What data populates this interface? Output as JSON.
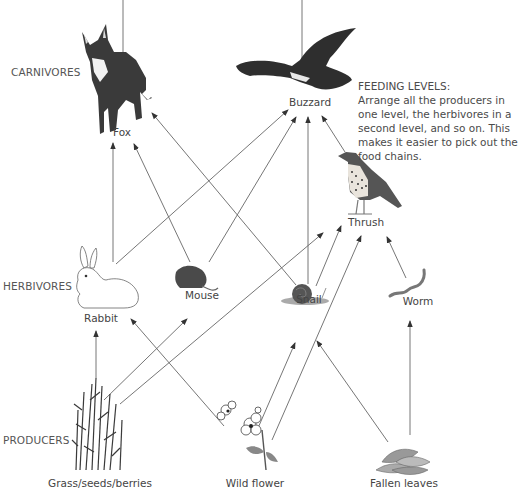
{
  "levels": {
    "carnivores": "CARNIVORES",
    "herbivores": "HERBIVORES",
    "producers": "PRODUCERS"
  },
  "organisms": {
    "fox": "Fox",
    "buzzard": "Buzzard",
    "thrush": "Thrush",
    "rabbit": "Rabbit",
    "mouse": "Mouse",
    "snail": "Snail",
    "worm": "Worm",
    "grass": "Grass/seeds/berries",
    "wild_flower": "Wild flower",
    "fallen_leaves": "Fallen leaves"
  },
  "note": {
    "title": "FEEDING LEVELS:",
    "body": "Arrange all the producers in one level, the herbivores in a second level, and so on. This makes it easier to pick out the food chains."
  },
  "food_web_links": [
    {
      "from": "Rabbit",
      "to": "Fox"
    },
    {
      "from": "Mouse",
      "to": "Fox"
    },
    {
      "from": "Snail",
      "to": "Fox"
    },
    {
      "from": "Rabbit",
      "to": "Buzzard"
    },
    {
      "from": "Mouse",
      "to": "Buzzard"
    },
    {
      "from": "Snail",
      "to": "Buzzard"
    },
    {
      "from": "Thrush",
      "to": "Buzzard"
    },
    {
      "from": "Snail",
      "to": "Thrush"
    },
    {
      "from": "Worm",
      "to": "Thrush"
    },
    {
      "from": "Grass/seeds/berries",
      "to": "Rabbit"
    },
    {
      "from": "Grass/seeds/berries",
      "to": "Mouse"
    },
    {
      "from": "Grass/seeds/berries",
      "to": "Thrush"
    },
    {
      "from": "Wild flower",
      "to": "Rabbit"
    },
    {
      "from": "Wild flower",
      "to": "Snail"
    },
    {
      "from": "Wild flower",
      "to": "Thrush"
    },
    {
      "from": "Fallen leaves",
      "to": "Snail"
    },
    {
      "from": "Fallen leaves",
      "to": "Worm"
    }
  ],
  "colors": {
    "line": "#555555",
    "animal_dark": "#2e2e2e",
    "text": "#4a4a4a"
  }
}
